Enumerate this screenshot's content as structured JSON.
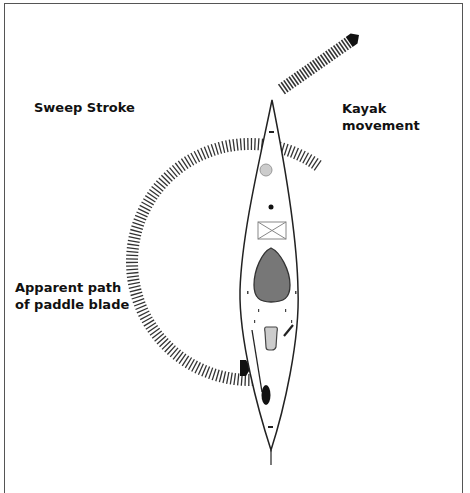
{
  "figure": {
    "title": "Sweep Stroke",
    "labels": {
      "kayak_movement": "Kayak\nmovement",
      "apparent_path": "Apparent path\nof paddle blade"
    },
    "caption_clipped": true,
    "caption": ""
  },
  "colors": {
    "line": "#222222",
    "hatch": "#333333",
    "front_hatch_fill": "#cccccc",
    "seat_fill": "#777777",
    "rear_hatch_fill": "#cfcfcf",
    "arrowhead": "#111111"
  },
  "elements": {
    "kayak": "kayak-outline",
    "arrows": [
      "kayak-movement-arrow",
      "paddle-path-arc-arrow"
    ]
  }
}
